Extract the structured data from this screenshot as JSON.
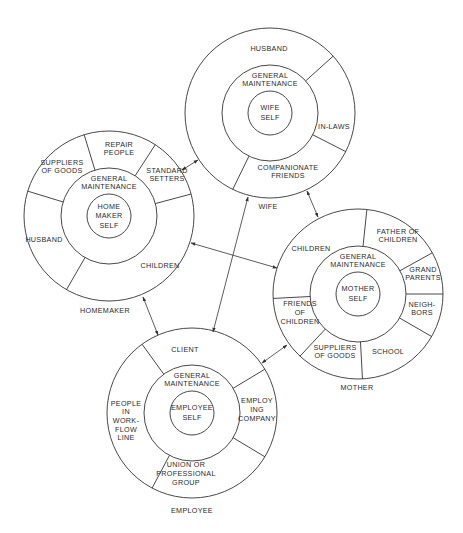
{
  "style": {
    "stroke": "#333333",
    "text": "#2a2a2a",
    "background": "#ffffff"
  },
  "radii": {
    "outer": 85,
    "middle": 48,
    "inner": 22
  },
  "roles": [
    {
      "id": "wife",
      "title": "WIFE",
      "center": [
        270,
        113
      ],
      "title_pos": [
        268,
        207
      ],
      "core": [
        "WIFE",
        "SELF"
      ],
      "middle": [
        "GENERAL",
        "MAINTENANCE"
      ],
      "divider_angles": [
        -42,
        27,
        116
      ],
      "segments": [
        {
          "lines": [
            "HUSBAND"
          ],
          "pos": [
            269,
            49
          ]
        },
        {
          "lines": [
            "IN-LAWS"
          ],
          "pos": [
            334,
            127
          ]
        },
        {
          "lines": [
            "COMPANIONATE",
            "FRIENDS"
          ],
          "pos": [
            288,
            172
          ]
        }
      ]
    },
    {
      "id": "homemaker",
      "title": "HOMEMAKER",
      "center": [
        109,
        216
      ],
      "title_pos": [
        105,
        311
      ],
      "core": [
        "HOME",
        "MAKER",
        "SELF"
      ],
      "middle": [
        "GENERAL",
        "MAINTENANCE"
      ],
      "divider_angles": [
        -163,
        -107,
        -57,
        -15,
        120
      ],
      "segments": [
        {
          "lines": [
            "SUPPLIERS",
            "OF GOODS"
          ],
          "pos": [
            62,
            167
          ]
        },
        {
          "lines": [
            "REPAIR",
            "PEOPLE"
          ],
          "pos": [
            119,
            149
          ]
        },
        {
          "lines": [
            "STANDARD",
            "SETTERS"
          ],
          "pos": [
            167,
            175
          ]
        },
        {
          "lines": [
            "HUSBAND"
          ],
          "pos": [
            44,
            240
          ]
        },
        {
          "lines": [
            "CHILDREN"
          ],
          "pos": [
            160,
            266
          ]
        }
      ]
    },
    {
      "id": "mother",
      "title": "MOTHER",
      "center": [
        358,
        294
      ],
      "title_pos": [
        357,
        388
      ],
      "core": [
        "MOTHER",
        "SELF"
      ],
      "middle": [
        "GENERAL",
        "MAINTENANCE"
      ],
      "divider_angles": [
        -84,
        -29,
        0,
        30,
        87,
        133,
        177
      ],
      "segments": [
        {
          "lines": [
            "CHILDREN"
          ],
          "pos": [
            311,
            249
          ]
        },
        {
          "lines": [
            "FATHER OF",
            "CHILDREN"
          ],
          "pos": [
            398,
            236
          ]
        },
        {
          "lines": [
            "GRAND",
            "PARENTS"
          ],
          "pos": [
            423,
            274
          ]
        },
        {
          "lines": [
            "NEIGH-",
            "BORS"
          ],
          "pos": [
            422,
            309
          ]
        },
        {
          "lines": [
            "SCHOOL"
          ],
          "pos": [
            388,
            352
          ]
        },
        {
          "lines": [
            "SUPPLIERS",
            "OF GOODS"
          ],
          "pos": [
            335,
            352
          ]
        },
        {
          "lines": [
            "FRIENDS",
            "OF",
            "CHILDREN"
          ],
          "pos": [
            300,
            313
          ]
        }
      ]
    },
    {
      "id": "employee",
      "title": "EMPLOYEE",
      "center": [
        192,
        413
      ],
      "title_pos": [
        192,
        511
      ],
      "core": [
        "EMPLOYEE",
        "SELF"
      ],
      "middle": [
        "GENERAL",
        "MAINTENANCE"
      ],
      "divider_angles": [
        -126,
        -31,
        31,
        118
      ],
      "segments": [
        {
          "lines": [
            "CLIENT"
          ],
          "pos": [
            185,
            350
          ]
        },
        {
          "lines": [
            "EMPLOY",
            "ING",
            "COMPANY"
          ],
          "pos": [
            257,
            410
          ]
        },
        {
          "lines": [
            "UNION OR",
            "PROFESSIONAL",
            "GROUP"
          ],
          "pos": [
            186,
            474
          ]
        },
        {
          "lines": [
            "PEOPLE",
            "IN",
            "WORK-",
            "FLOW",
            "LINE"
          ],
          "pos": [
            126,
            421
          ]
        }
      ]
    }
  ],
  "links": [
    {
      "from": "homemaker",
      "to": "wife",
      "p1": [
        182,
        170
      ],
      "p2": [
        198,
        160
      ]
    },
    {
      "from": "homemaker",
      "to": "mother",
      "p1": [
        191,
        243
      ],
      "p2": [
        277,
        268
      ]
    },
    {
      "from": "wife",
      "to": "employee",
      "p1": [
        248,
        197
      ],
      "p2": [
        213,
        332
      ]
    },
    {
      "from": "homemaker",
      "to": "employee",
      "p1": [
        143,
        297
      ],
      "p2": [
        158,
        335
      ]
    },
    {
      "from": "wife",
      "to": "mother",
      "p1": [
        307,
        191
      ],
      "p2": [
        318,
        217
      ]
    },
    {
      "from": "employee",
      "to": "mother",
      "p1": [
        262,
        363
      ],
      "p2": [
        287,
        345
      ]
    }
  ]
}
